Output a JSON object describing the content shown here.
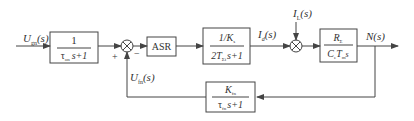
{
  "diagram": {
    "type": "block-diagram",
    "colors": {
      "line": "#444444",
      "text": "#333333",
      "background": "#ffffff"
    },
    "signals": {
      "input": {
        "main": "U",
        "sub": "gn",
        "arg": "(s)"
      },
      "current": {
        "main": "I",
        "sub": "d",
        "arg": "(s)"
      },
      "load": {
        "main": "I",
        "sub": "L",
        "arg": "(s)"
      },
      "output": {
        "main": "N",
        "sub": "",
        "arg": "(s)"
      },
      "feedback": {
        "main": "U",
        "sub": "fn",
        "arg": "(s)"
      }
    },
    "summing_junctions": [
      {
        "id": "sum1",
        "signs": {
          "plus": "+",
          "minus": "−"
        }
      },
      {
        "id": "sum2"
      }
    ],
    "blocks": [
      {
        "id": "input-filter",
        "numerator": "1",
        "denominator": {
          "tau": "τ",
          "sub": "on",
          "rest": "s+1"
        }
      },
      {
        "id": "asr",
        "label": "ASR"
      },
      {
        "id": "current-loop",
        "numerator": {
          "main": "1/K",
          "sub": "s"
        },
        "denominator": {
          "pre": "2T",
          "sub": "Σi",
          "rest": "s+1"
        }
      },
      {
        "id": "motor",
        "numerator": {
          "main": "R",
          "sub": "Σ"
        },
        "denominator": {
          "c": "C",
          "csub": "e",
          "t": "T",
          "tsub": "m",
          "rest": "s"
        }
      },
      {
        "id": "feedback-filter",
        "numerator": {
          "main": "K",
          "sub": "fn"
        },
        "denominator": {
          "tau": "τ",
          "sub": "fn",
          "rest": "s+1"
        }
      }
    ]
  }
}
